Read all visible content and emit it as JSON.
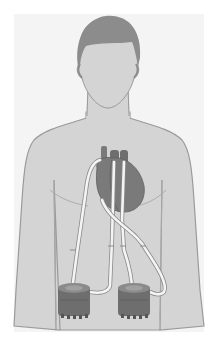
{
  "figure": {
    "subject": "Human torso illustration with heart connected by cannulae to two external pumps",
    "colors": {
      "background": "#ffffff",
      "skin": "#d4d4d4",
      "skin_outline": "#9a9a9a",
      "hair": "#8c8c8c",
      "heart": "#7a7a7a",
      "heart_dark": "#666666",
      "tube": "#f4f4f4",
      "tube_outline": "#9a9a9a",
      "pump": "#6e6e6e",
      "pump_top": "#8a8a8a"
    },
    "components": [
      {
        "name": "head"
      },
      {
        "name": "torso"
      },
      {
        "name": "heart"
      },
      {
        "name": "cannula-1"
      },
      {
        "name": "cannula-2"
      },
      {
        "name": "cannula-3"
      },
      {
        "name": "cannula-4"
      },
      {
        "name": "pump-left"
      },
      {
        "name": "pump-right"
      }
    ]
  }
}
